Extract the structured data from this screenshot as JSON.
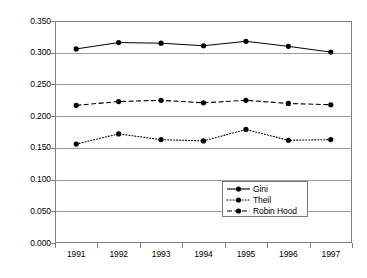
{
  "chart_data": {
    "type": "line",
    "title": "",
    "subtitle": "",
    "xlabel": "",
    "ylabel": "",
    "categories": [
      "1991",
      "1992",
      "1993",
      "1994",
      "1995",
      "1996",
      "1997"
    ],
    "ylim": [
      0.0,
      0.35
    ],
    "ytick_labels": [
      "0.350",
      "0.300",
      "0.250",
      "0.200",
      "0.150",
      "0.100",
      "0.050",
      "0.000"
    ],
    "ytick_values": [
      0.35,
      0.3,
      0.25,
      0.2,
      0.15,
      0.1,
      0.05,
      0.0
    ],
    "grid": "horizontal",
    "legend_position": "inside-lower-right",
    "series": [
      {
        "name": "Gini",
        "style": "solid",
        "marker": "filled-circle",
        "color": "#000000",
        "values": [
          0.306,
          0.316,
          0.315,
          0.311,
          0.318,
          0.31,
          0.301
        ]
      },
      {
        "name": "Theil",
        "style": "dotted",
        "marker": "filled-circle",
        "color": "#000000",
        "values": [
          0.156,
          0.172,
          0.163,
          0.161,
          0.179,
          0.162,
          0.163
        ]
      },
      {
        "name": "Robin Hood",
        "style": "dashed",
        "marker": "filled-circle",
        "color": "#000000",
        "values": [
          0.217,
          0.223,
          0.225,
          0.221,
          0.225,
          0.22,
          0.218
        ]
      }
    ]
  },
  "legend": {
    "entries": [
      {
        "label": "Gini"
      },
      {
        "label": "Theil"
      },
      {
        "label": "Robin Hood"
      }
    ]
  },
  "colors": {
    "axis": "#808080",
    "grid": "#9a9a9a",
    "series": "#000000",
    "background": "#ffffff"
  }
}
